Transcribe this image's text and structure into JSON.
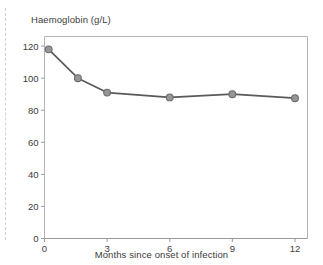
{
  "figure": {
    "title": "Haemoglobin (g/L)",
    "xlabel": "Months since onset of infection",
    "margin_rule": "dashed-margin-line"
  },
  "chart_data": {
    "type": "line",
    "title": "Haemoglobin (g/L)",
    "xlabel": "Months since onset of infection",
    "ylabel": "Haemoglobin (g/L)",
    "xlim": [
      0,
      12.6
    ],
    "ylim": [
      0,
      126
    ],
    "xticks": [
      0,
      3,
      6,
      9,
      12
    ],
    "yticks": [
      0,
      20,
      40,
      60,
      80,
      100,
      120
    ],
    "xtick_labels": [
      "0",
      "3",
      "6",
      "9",
      "12"
    ],
    "ytick_labels": [
      "0",
      "20",
      "40",
      "60",
      "80",
      "100",
      "120"
    ],
    "grid": false,
    "legend": null,
    "marker": "circle",
    "line_color": "#5a5a5a",
    "marker_face_color": "#969696",
    "marker_edge_color": "#6b6b6b",
    "series": [
      {
        "name": "Haemoglobin",
        "points": [
          {
            "x": 0.2,
            "y": 118
          },
          {
            "x": 1.6,
            "y": 100
          },
          {
            "x": 3.0,
            "y": 91
          },
          {
            "x": 6.0,
            "y": 88
          },
          {
            "x": 9.0,
            "y": 90
          },
          {
            "x": 12.0,
            "y": 87.5
          }
        ]
      }
    ]
  }
}
